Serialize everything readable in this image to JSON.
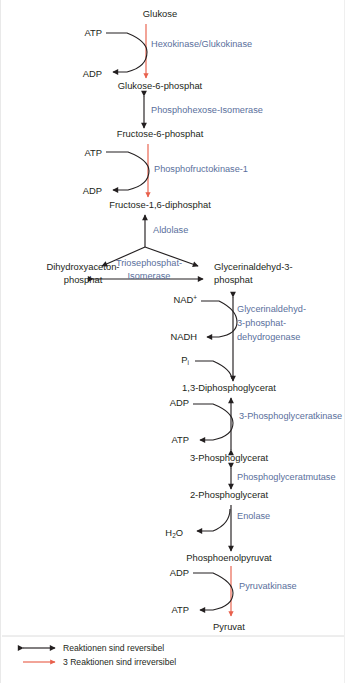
{
  "figure": {
    "language": "de",
    "colors": {
      "text": "#231f20",
      "enzyme_blue": "#5a6f9c",
      "irreversible_red": "#e8604c",
      "reversible_black": "#231f20",
      "background": "#ffffff"
    }
  },
  "metabolites": [
    {
      "id": "glukose",
      "label": "Glukose",
      "x": 159,
      "y": 17,
      "anchor": "middle"
    },
    {
      "id": "glukose6p",
      "label": "Glukose-6-phosphat",
      "x": 159,
      "y": 89,
      "anchor": "middle"
    },
    {
      "id": "fructose6p",
      "label": "Fructose-6-phosphat",
      "x": 159,
      "y": 137,
      "anchor": "middle"
    },
    {
      "id": "fructose16dp",
      "label": "Fructose-1,6-diphosphat",
      "x": 159,
      "y": 208,
      "anchor": "middle"
    },
    {
      "id": "dhap_l1",
      "label": "Dihydroxyaceton-",
      "x": 82,
      "y": 270,
      "anchor": "middle"
    },
    {
      "id": "dhap_l2",
      "label": "phosphat",
      "x": 82,
      "y": 283,
      "anchor": "middle"
    },
    {
      "id": "gap_l1",
      "label": "Glycerinaldehyd-3-",
      "x": 213,
      "y": 270,
      "anchor": "start"
    },
    {
      "id": "gap_l2",
      "label": "phosphat",
      "x": 213,
      "y": 283,
      "anchor": "start"
    },
    {
      "id": "dpg13",
      "label": "1,3-Diphosphoglycerat",
      "x": 228,
      "y": 391,
      "anchor": "middle"
    },
    {
      "id": "pg3",
      "label": "3-Phosphoglycerat",
      "x": 228,
      "y": 461,
      "anchor": "middle"
    },
    {
      "id": "pg2",
      "label": "2-Phosphoglycerat",
      "x": 228,
      "y": 498,
      "anchor": "middle"
    },
    {
      "id": "pep",
      "label": "Phosphoenolpyruvat",
      "x": 228,
      "y": 561,
      "anchor": "middle"
    },
    {
      "id": "pyruvat",
      "label": "Pyruvat",
      "x": 228,
      "y": 630,
      "anchor": "middle"
    }
  ],
  "cofactors": [
    {
      "id": "atp1",
      "label": "ATP",
      "x": 101,
      "y": 36,
      "anchor": "end"
    },
    {
      "id": "adp1",
      "label": "ADP",
      "x": 101,
      "y": 77,
      "anchor": "end"
    },
    {
      "id": "atp2",
      "label": "ATP",
      "x": 101,
      "y": 156,
      "anchor": "end"
    },
    {
      "id": "adp2",
      "label": "ADP",
      "x": 101,
      "y": 194,
      "anchor": "end"
    },
    {
      "id": "nadplus",
      "label": "NAD",
      "sup": "+",
      "x": 196,
      "y": 303,
      "anchor": "end"
    },
    {
      "id": "nadh",
      "label": "NADH",
      "x": 196,
      "y": 340,
      "anchor": "end"
    },
    {
      "id": "pi",
      "label": "P",
      "sub": "i",
      "x": 188,
      "y": 363,
      "anchor": "end"
    },
    {
      "id": "adp3",
      "label": "ADP",
      "x": 188,
      "y": 406,
      "anchor": "end"
    },
    {
      "id": "atp3",
      "label": "ATP",
      "x": 188,
      "y": 443,
      "anchor": "end"
    },
    {
      "id": "h2o",
      "label": "H",
      "sub": "2",
      "label2": "O",
      "x": 182,
      "y": 536,
      "anchor": "end"
    },
    {
      "id": "adp4",
      "label": "ADP",
      "x": 188,
      "y": 576,
      "anchor": "end"
    },
    {
      "id": "atp4",
      "label": "ATP",
      "x": 188,
      "y": 613,
      "anchor": "end"
    }
  ],
  "enzymes": [
    {
      "id": "hexokinase",
      "label": "Hexokinase/Glukokinase",
      "x": 150,
      "y": 47,
      "anchor": "start",
      "reversible": false
    },
    {
      "id": "phosphohexose_isomerase",
      "label": "Phosphohexose-Isomerase",
      "x": 150,
      "y": 113,
      "anchor": "start",
      "reversible": true
    },
    {
      "id": "pfk1",
      "label": "Phosphofructokinase-1",
      "x": 153,
      "y": 172,
      "anchor": "start",
      "reversible": false
    },
    {
      "id": "aldolase",
      "label": "Aldolase",
      "x": 152,
      "y": 233,
      "anchor": "start",
      "reversible": true
    },
    {
      "id": "triosephosphat_isomerase_l1",
      "label": "Triosephosphat-",
      "x": 148,
      "y": 266,
      "anchor": "middle",
      "reversible": true
    },
    {
      "id": "triosephosphat_isomerase_l2",
      "label": "Isomerase",
      "x": 148,
      "y": 279,
      "anchor": "middle",
      "reversible": true
    },
    {
      "id": "gapdh_l1",
      "label": "Glycerinaldehyd-",
      "x": 236,
      "y": 312,
      "anchor": "start",
      "reversible": true
    },
    {
      "id": "gapdh_l2",
      "label": "3-phosphat-",
      "x": 236,
      "y": 326,
      "anchor": "start",
      "reversible": true
    },
    {
      "id": "gapdh_l3",
      "label": "dehydrogenase",
      "x": 236,
      "y": 340,
      "anchor": "start",
      "reversible": true
    },
    {
      "id": "pgk",
      "label": "3-Phosphoglyceratkinase",
      "x": 238,
      "y": 419,
      "anchor": "start",
      "reversible": true
    },
    {
      "id": "pgm",
      "label": "Phosphoglyceratmutase",
      "x": 236,
      "y": 480,
      "anchor": "start",
      "reversible": true
    },
    {
      "id": "enolase",
      "label": "Enolase",
      "x": 236,
      "y": 519,
      "anchor": "start",
      "reversible": true
    },
    {
      "id": "pyruvatkinase",
      "label": "Pyruvatkinase",
      "x": 238,
      "y": 589,
      "anchor": "start",
      "reversible": false
    }
  ],
  "legend": {
    "items": [
      {
        "id": "reversible",
        "label": "Reaktionen sind reversibel",
        "arrow": "double-black",
        "color": "#231f20",
        "y": 651
      },
      {
        "id": "irreversible",
        "label": "3 Reaktionen sind irreversibel",
        "arrow": "single-red",
        "color": "#e8604c",
        "y": 665
      }
    ],
    "label_x": 62
  }
}
